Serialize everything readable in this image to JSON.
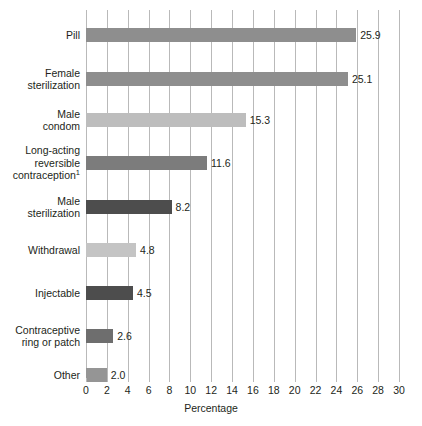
{
  "chart_data": {
    "type": "bar",
    "orientation": "horizontal",
    "title": "",
    "xlabel": "Percentage",
    "ylabel": "",
    "xlim": [
      0,
      30
    ],
    "xticks": [
      0,
      2,
      4,
      6,
      8,
      10,
      12,
      14,
      16,
      18,
      20,
      22,
      24,
      26,
      28,
      30
    ],
    "xtick_labels": [
      "0",
      "2",
      "4",
      "6",
      "8",
      "10",
      "12",
      "14",
      "16",
      "18",
      "20",
      "22",
      "24",
      "26",
      "28",
      "30"
    ],
    "grid": "vertical",
    "legend": "none",
    "categories": [
      "Pill",
      "Female sterilization",
      "Male condom",
      "Long-acting reversible contraception¹",
      "Male sterilization",
      "Withdrawal",
      "Injectable",
      "Contraceptive ring or patch",
      "Other"
    ],
    "values": [
      25.9,
      25.1,
      15.3,
      11.6,
      8.2,
      4.8,
      4.5,
      2.6,
      2.0
    ],
    "value_labels": [
      "25.9",
      "25.1",
      "15.3",
      "11.6",
      "8.2",
      "4.8",
      "4.5",
      "2.6",
      "2.0"
    ],
    "bar_colors": [
      "#8e8e8e",
      "#8e8e8e",
      "#bdbdbd",
      "#7c7c7c",
      "#4d4d4d",
      "#c4c4c4",
      "#4d4d4d",
      "#6e6e6e",
      "#959595"
    ],
    "category_lines": [
      [
        "Pill"
      ],
      [
        "Female",
        "sterilization"
      ],
      [
        "Male",
        "condom"
      ],
      [
        "Long-acting",
        "reversible",
        "contraception|1"
      ],
      [
        "Male",
        "sterilization"
      ],
      [
        "Withdrawal"
      ],
      [
        "Injectable"
      ],
      [
        "Contraceptive",
        "ring or patch"
      ],
      [
        "Other"
      ]
    ]
  },
  "axis": {
    "x_title": "Percentage"
  },
  "colors": {
    "grid": "#b9b9b9",
    "text": "#231f20",
    "background": "#ffffff"
  }
}
